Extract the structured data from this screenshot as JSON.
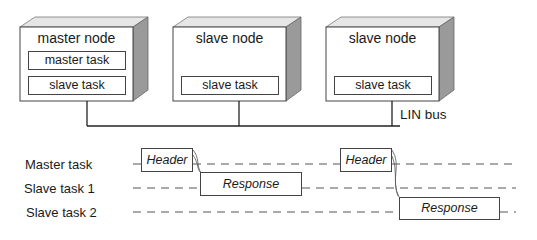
{
  "nodes": [
    {
      "title": "master node",
      "tasks": [
        "master task",
        "slave task"
      ]
    },
    {
      "title": "slave node",
      "tasks": [
        "slave task"
      ]
    },
    {
      "title": "slave node",
      "tasks": [
        "slave task"
      ]
    }
  ],
  "bus_label": "LIN bus",
  "timeline": {
    "rows": [
      "Master task",
      "Slave task 1",
      "Slave task 2"
    ],
    "frames": [
      {
        "label": "Header",
        "row": 0
      },
      {
        "label": "Response",
        "row": 1
      },
      {
        "label": "Header",
        "row": 0
      },
      {
        "label": "Response",
        "row": 2
      }
    ]
  }
}
